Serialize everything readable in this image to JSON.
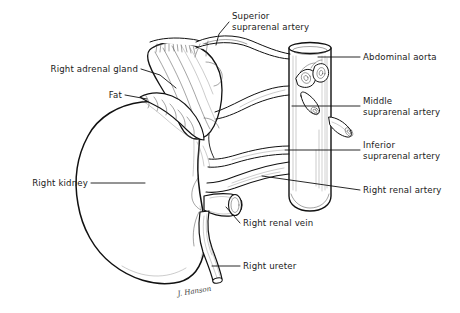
{
  "figure": {
    "background_color": "#ffffff",
    "ink_color": "#111111",
    "text_color": "#1a1a1a",
    "width": 460,
    "height": 313,
    "signature": "J. Hanson"
  },
  "labels": [
    {
      "id": "superior-suprarenal-artery",
      "lines": [
        "Superior",
        "suprarenal artery"
      ],
      "x": 232,
      "y": 19,
      "align": "start",
      "structure": "superior suprarenal arteries"
    },
    {
      "id": "abdominal-aorta",
      "lines": [
        "Abdominal aorta"
      ],
      "x": 363,
      "y": 59,
      "align": "start",
      "structure": "abdominal aorta"
    },
    {
      "id": "middle-suprarenal-artery",
      "lines": [
        "Middle",
        "suprarenal artery"
      ],
      "x": 363,
      "y": 108,
      "align": "start",
      "structure": "middle suprarenal artery"
    },
    {
      "id": "inferior-suprarenal-artery",
      "lines": [
        "Inferior",
        "suprarenal artery"
      ],
      "x": 363,
      "y": 152,
      "align": "start",
      "structure": "inferior suprarenal artery"
    },
    {
      "id": "right-renal-artery",
      "lines": [
        "Right renal artery"
      ],
      "x": 363,
      "y": 192,
      "align": "start",
      "structure": "right renal artery"
    },
    {
      "id": "right-adrenal-gland",
      "lines": [
        "Right adrenal gland"
      ],
      "x": 138,
      "y": 72,
      "align": "end",
      "structure": "right adrenal (suprarenal) gland"
    },
    {
      "id": "fat",
      "lines": [
        "Fat"
      ],
      "x": 122,
      "y": 98,
      "align": "end",
      "structure": "perirenal fat"
    },
    {
      "id": "right-kidney",
      "lines": [
        "Right kidney"
      ],
      "x": 88,
      "y": 186,
      "align": "end",
      "structure": "right kidney"
    },
    {
      "id": "right-renal-vein",
      "lines": [
        "Right renal vein"
      ],
      "x": 243,
      "y": 226,
      "align": "start",
      "structure": "right renal vein"
    },
    {
      "id": "right-ureter",
      "lines": [
        "Right ureter"
      ],
      "x": 243,
      "y": 269,
      "align": "start",
      "structure": "right ureter"
    }
  ],
  "structures": [
    {
      "id": "kidney",
      "name": "Right kidney",
      "note": "large bean-shaped organ, left of frame"
    },
    {
      "id": "adrenal-gland",
      "name": "Right adrenal gland",
      "note": "striated cap superior to kidney"
    },
    {
      "id": "fat",
      "name": "Fat",
      "note": "lobulated perirenal fat band"
    },
    {
      "id": "aorta",
      "name": "Abdominal aorta",
      "note": "vertical cylinder, right of frame"
    },
    {
      "id": "renal-vein",
      "name": "Right renal vein",
      "note": "cut vessel stump at renal hilum"
    },
    {
      "id": "ureter",
      "name": "Right ureter",
      "note": "descending tube from hilum"
    },
    {
      "id": "superior-suprarenal-arteries",
      "name": "Superior suprarenal arteries",
      "note": "fine arcade to gland apex"
    },
    {
      "id": "middle-suprarenal-artery",
      "name": "Middle suprarenal artery",
      "note": "branch from aorta"
    },
    {
      "id": "inferior-suprarenal-artery",
      "name": "Inferior suprarenal artery",
      "note": "branch from renal artery"
    },
    {
      "id": "renal-artery",
      "name": "Right renal artery",
      "note": "from aorta to hilum"
    }
  ]
}
